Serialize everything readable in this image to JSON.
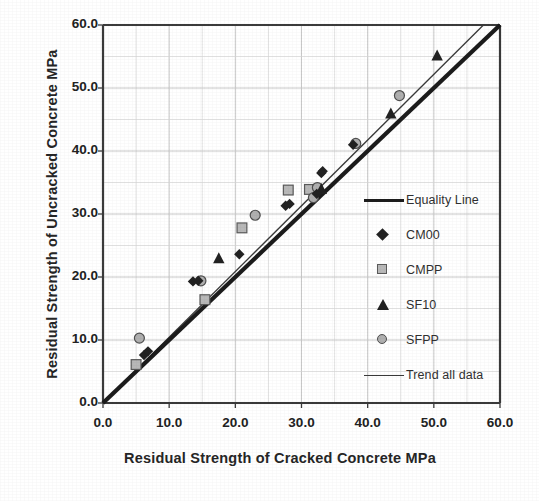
{
  "chart_data": {
    "type": "scatter",
    "title": "",
    "xlabel": "Residual Strength of Cracked Concrete   MPa",
    "ylabel": "Residual Strength of Uncracked Concrete  MPa",
    "xlim": [
      0.0,
      60.0
    ],
    "ylim": [
      0.0,
      60.0
    ],
    "xticks": [
      "0.0",
      "10.0",
      "20.0",
      "30.0",
      "40.0",
      "50.0",
      "60.0"
    ],
    "yticks": [
      "0.0",
      "10.0",
      "20.0",
      "30.0",
      "40.0",
      "50.0",
      "60.0"
    ],
    "xtick_values": [
      0,
      10,
      20,
      30,
      40,
      50,
      60
    ],
    "ytick_values": [
      0,
      10,
      20,
      30,
      40,
      50,
      60
    ],
    "grid": true,
    "grid_minor_step": 5,
    "grid_major_step": 10,
    "legend_position": "center-right",
    "series": [
      {
        "name": "Equality Line",
        "type": "line",
        "marker": "line-thick",
        "color": "#1c1c1c",
        "x": [
          0,
          60
        ],
        "y": [
          0,
          60
        ]
      },
      {
        "name": "CM00",
        "type": "scatter",
        "marker": "diamond",
        "color": "#222222",
        "points": [
          [
            6.2,
            7.6
          ],
          [
            6.8,
            8.2
          ],
          [
            13.6,
            19.3
          ],
          [
            14.4,
            19.4
          ],
          [
            20.6,
            23.6
          ],
          [
            27.6,
            31.3
          ],
          [
            28.2,
            31.6
          ],
          [
            32.3,
            33.2
          ],
          [
            33.0,
            36.5
          ],
          [
            33.2,
            36.8
          ],
          [
            37.8,
            41.0
          ]
        ]
      },
      {
        "name": "CMPP",
        "type": "scatter",
        "marker": "square",
        "color": "#b8b8b8",
        "edge_color": "#5a5a5a",
        "points": [
          [
            5.0,
            6.1
          ],
          [
            15.4,
            16.4
          ],
          [
            21.0,
            27.8
          ],
          [
            28.0,
            33.8
          ],
          [
            31.2,
            33.9
          ]
        ]
      },
      {
        "name": "SF10",
        "type": "scatter",
        "marker": "triangle",
        "color": "#222222",
        "points": [
          [
            17.5,
            23.0
          ],
          [
            33.0,
            34.0
          ],
          [
            43.5,
            46.0
          ],
          [
            50.5,
            55.2
          ]
        ]
      },
      {
        "name": "SFPP",
        "type": "scatter",
        "marker": "circle",
        "color": "#b0b0b0",
        "edge_color": "#4f4f4f",
        "points": [
          [
            5.5,
            10.3
          ],
          [
            14.8,
            19.4
          ],
          [
            23.0,
            29.8
          ],
          [
            31.8,
            32.6
          ],
          [
            32.4,
            34.2
          ],
          [
            38.2,
            41.2
          ],
          [
            44.8,
            48.8
          ]
        ]
      },
      {
        "name": "Trend all data",
        "type": "line",
        "marker": "line-thin",
        "color": "#3a3a3a",
        "x": [
          0,
          57.5
        ],
        "y": [
          0,
          60.0
        ]
      }
    ]
  },
  "legend": {
    "items": [
      {
        "label": "Equality Line",
        "marker": "line-thick"
      },
      {
        "label": "CM00",
        "marker": "diamond"
      },
      {
        "label": "CMPP",
        "marker": "square"
      },
      {
        "label": "SF10",
        "marker": "triangle"
      },
      {
        "label": "SFPP",
        "marker": "circle"
      },
      {
        "label": "Trend all data",
        "marker": "line-thin"
      }
    ]
  },
  "colors": {
    "axis": "#3a3a3a",
    "grid_minor": "#d9d9d9",
    "grid_major": "#c2c2c2",
    "equality_line": "#1c1c1c",
    "trend_line": "#3a3a3a",
    "marker_dark": "#222222",
    "marker_gray": "#b4b4b4",
    "background": "#ffffff"
  }
}
